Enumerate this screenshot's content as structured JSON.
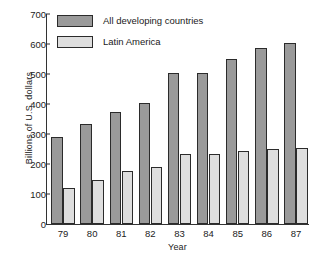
{
  "chart_data": {
    "type": "bar",
    "title": "",
    "xlabel": "Year",
    "ylabel": "Billions of U.S. dollars",
    "categories": [
      "79",
      "80",
      "81",
      "82",
      "83",
      "84",
      "85",
      "86",
      "87"
    ],
    "series": [
      {
        "name": "All developing countries",
        "color": "#9a9a9a",
        "values": [
          290,
          333,
          375,
          403,
          505,
          505,
          550,
          588,
          605
        ]
      },
      {
        "name": "Latin America",
        "color": "#dedede",
        "values": [
          120,
          148,
          178,
          190,
          235,
          235,
          243,
          250,
          253
        ]
      }
    ],
    "ylim": [
      0,
      700
    ],
    "yticks": [
      0,
      100,
      200,
      300,
      400,
      500,
      600,
      700
    ],
    "ytick_labels": [
      "0",
      "100",
      "200",
      "300",
      "400",
      "500",
      "600",
      "700"
    ],
    "grid": false,
    "legend_position": "top-left"
  },
  "legend": {
    "entries": [
      {
        "label": "All developing countries",
        "swatch": "dark"
      },
      {
        "label": "Latin America",
        "swatch": "light"
      }
    ]
  }
}
